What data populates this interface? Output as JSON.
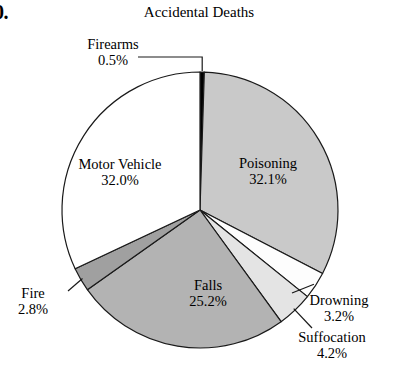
{
  "figure": {
    "problem_number": "0.",
    "title": "Accidental Deaths"
  },
  "chart_data": {
    "type": "pie",
    "title": "Accidental Deaths",
    "xlabel": "",
    "ylabel": "",
    "legend_position": "none",
    "grid": false,
    "start_angle_deg": 0,
    "direction": "clockwise",
    "units": "percent",
    "categories": [
      "Firearms",
      "Poisoning",
      "Drowning",
      "Suffocation",
      "Falls",
      "Fire",
      "Motor Vehicle"
    ],
    "values": [
      0.5,
      32.1,
      3.2,
      4.2,
      25.2,
      2.8,
      32.0
    ],
    "total": 100.0,
    "colors": [
      "#000000",
      "#c9c9c9",
      "#fdfdfd",
      "#e4e4e4",
      "#b3b3b3",
      "#a0a0a0",
      "#ffffff"
    ],
    "slices": [
      {
        "name": "Firearms",
        "value": 0.5,
        "label": "Firearms",
        "percent_label": "0.5%",
        "color": "#000000",
        "label_placement": "outside",
        "leader_line": true
      },
      {
        "name": "Poisoning",
        "value": 32.1,
        "label": "Poisoning",
        "percent_label": "32.1%",
        "color": "#c9c9c9",
        "label_placement": "inside",
        "leader_line": false
      },
      {
        "name": "Drowning",
        "value": 3.2,
        "label": "Drowning",
        "percent_label": "3.2%",
        "color": "#fdfdfd",
        "label_placement": "outside",
        "leader_line": true
      },
      {
        "name": "Suffocation",
        "value": 4.2,
        "label": "Suffocation",
        "percent_label": "4.2%",
        "color": "#e4e4e4",
        "label_placement": "outside",
        "leader_line": true
      },
      {
        "name": "Falls",
        "value": 25.2,
        "label": "Falls",
        "percent_label": "25.2%",
        "color": "#b3b3b3",
        "label_placement": "inside",
        "leader_line": false
      },
      {
        "name": "Fire",
        "value": 2.8,
        "label": "Fire",
        "percent_label": "2.8%",
        "color": "#a0a0a0",
        "label_placement": "outside",
        "leader_line": true
      },
      {
        "name": "Motor Vehicle",
        "value": 32.0,
        "label": "Motor Vehicle",
        "percent_label": "32.0%",
        "color": "#ffffff",
        "label_placement": "inside",
        "leader_line": false
      }
    ]
  }
}
